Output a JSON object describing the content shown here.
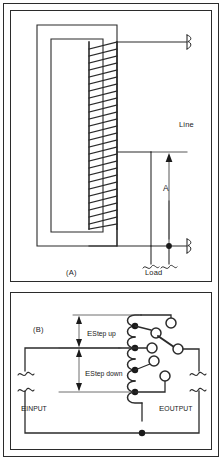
{
  "figure": {
    "type": "electrical-schematic",
    "title_visible": false,
    "panels": [
      {
        "id": "A",
        "caption": "(A)",
        "description": "autotransformer with tapped winding on laminated core",
        "labels": {
          "line": "Line",
          "load": "Load",
          "dimension": "A"
        },
        "winding_turns": 26,
        "terminals": [
          {
            "name": "line-top-terminal",
            "style": "squiggle"
          },
          {
            "name": "load-left-terminal",
            "style": "squiggle"
          },
          {
            "name": "load-right-terminal",
            "style": "squiggle"
          },
          {
            "name": "line-bottom-terminal",
            "style": "squiggle"
          }
        ],
        "junction_dots": 1
      },
      {
        "id": "B",
        "caption": "(B)",
        "description": "tapped transformer winding with rotary selector switch providing step up and step down output",
        "labels": {
          "e_step_up_cap": "E",
          "e_step_up_sub": "Step up",
          "e_step_down_cap": "E",
          "e_step_down_sub": "Step down",
          "e_input_cap": "E",
          "e_input_sub": "INPUT",
          "e_output_cap": "E",
          "e_output_sub": "OUTPUT"
        },
        "winding_taps": 4,
        "switch_contacts": 4,
        "switch_selected_contact_index": 2,
        "terminals": [
          {
            "name": "e-input-top-terminal",
            "style": "squiggle"
          },
          {
            "name": "e-input-bottom-terminal",
            "style": "squiggle"
          },
          {
            "name": "e-output-top-terminal",
            "style": "squiggle"
          },
          {
            "name": "e-output-bottom-terminal",
            "style": "squiggle"
          }
        ],
        "junction_dots": 5
      }
    ],
    "colors": {
      "line": "#2b2b2b",
      "text": "#1a1a1a",
      "background": "#ffffff"
    }
  }
}
